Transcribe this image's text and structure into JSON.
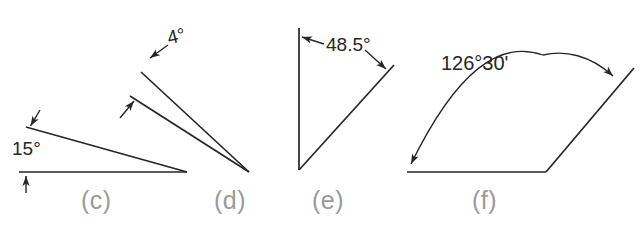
{
  "document": {
    "type": "engineering-drawing",
    "subject": "angular dimensioning examples",
    "background_color": "#ffffff",
    "line_color": "#262626",
    "label_color": "#9a9a9a"
  },
  "figures": [
    {
      "key": "c",
      "label": "(c)",
      "dimension_text": "15°",
      "angle_degrees": 15,
      "description": "acute angle between a horizontal base line and an upward-left sloping line, vertex at right",
      "annotation_style": "two opposing arrowheads outside the angle with the value between them"
    },
    {
      "key": "d",
      "label": "(d)",
      "dimension_text": "4°",
      "angle_degrees": 4,
      "description": "very narrow wedge formed by two nearly parallel lines converging at lower right",
      "annotation_style": "leader line with arrowhead into the narrow wedge plus a small arrow from outside"
    },
    {
      "key": "e",
      "label": "(e)",
      "dimension_text": "48.5°",
      "angle_degrees": 48.5,
      "description": "angle between a vertical line and a line sloping up to the right, vertex at bottom",
      "annotation_style": "value placed inside the angle with two leader lines and arrowheads to each side"
    },
    {
      "key": "f",
      "label": "(f)",
      "dimension_text": "126°30'",
      "angle_degrees": 126.5,
      "description": "obtuse angle between a horizontal base line and a line sloping up to the right",
      "annotation_style": "curved dimension arc with arrowheads at both ends and value above the arc"
    }
  ],
  "icons": {
    "arrowhead": "arrowhead-icon",
    "leader_line": "leader-line-icon",
    "dimension_arc": "dimension-arc-icon"
  }
}
